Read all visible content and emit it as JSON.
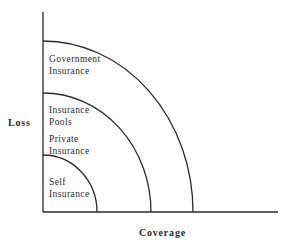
{
  "diagram": {
    "axes": {
      "y_label": "Loss",
      "x_label": "Coverage"
    },
    "regions": [
      {
        "name": "self-insurance",
        "lines": [
          "Self",
          "Insurance"
        ]
      },
      {
        "name": "private-insurance",
        "lines": [
          "Private",
          "Insurance"
        ]
      },
      {
        "name": "insurance-pools",
        "lines": [
          "Insurance",
          "Pools"
        ]
      },
      {
        "name": "government-insurance",
        "lines": [
          "Government",
          "Insurance"
        ]
      }
    ],
    "boundaries": [
      {
        "name": "self-insurance-boundary"
      },
      {
        "name": "pools-boundary"
      },
      {
        "name": "government-boundary"
      }
    ]
  }
}
